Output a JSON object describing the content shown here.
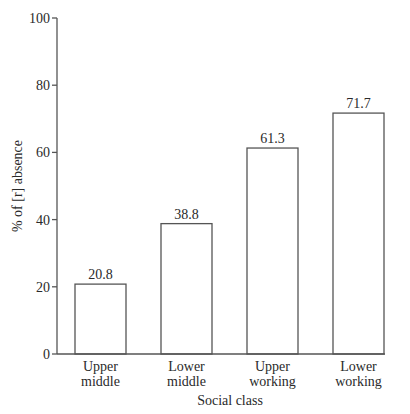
{
  "chart_data": {
    "type": "bar",
    "title": "",
    "xlabel": "Social class",
    "ylabel": "% of [r] absence",
    "categories": [
      "Upper middle",
      "Lower middle",
      "Upper working",
      "Lower working"
    ],
    "category_lines": [
      [
        "Upper",
        "middle"
      ],
      [
        "Lower",
        "middle"
      ],
      [
        "Upper",
        "working"
      ],
      [
        "Lower",
        "working"
      ]
    ],
    "values": [
      20.8,
      38.8,
      61.3,
      71.7
    ],
    "value_labels": [
      "20.8",
      "38.8",
      "61.3",
      "71.7"
    ],
    "ylim": [
      0,
      100
    ],
    "yticks": [
      0,
      20,
      40,
      60,
      80,
      100
    ],
    "grid": false,
    "legend": null
  }
}
